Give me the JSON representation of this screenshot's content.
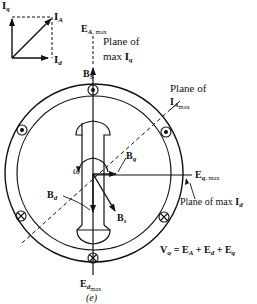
{
  "phasor": {
    "iq": {
      "sym": "I",
      "sub": "q"
    },
    "ia": {
      "sym": "I",
      "sub": "A"
    },
    "id": {
      "sym": "I",
      "sub": "d"
    }
  },
  "labels": {
    "ea_max": {
      "sym": "E",
      "sub": "A",
      "suffix": ", max"
    },
    "plane_iq": {
      "line1": "Plane of",
      "line2": "max ",
      "sym": "I",
      "sub": "q"
    },
    "bs_top": {
      "sym": "B",
      "sub": "S"
    },
    "plane_ia": {
      "line1": "Plane of",
      "sym": "I",
      "sub": "A",
      "subsub": "max"
    },
    "omega": "ω",
    "bq": {
      "sym": "B",
      "sub": "q"
    },
    "bd": {
      "sym": "B",
      "sub": "d"
    },
    "bs": {
      "sym": "B",
      "sub": "s"
    },
    "eq_max": {
      "sym": "E",
      "sub": "q",
      "suffix": ", max"
    },
    "plane_id": {
      "text": "Plane of max ",
      "sym": "I",
      "sub": "d"
    },
    "equation": {
      "v": "V",
      "vsub": "φ",
      "eq": " = ",
      "ea": "E",
      "easub": "A",
      "plus1": " + ",
      "ed": "E",
      "edsub": "d",
      "plus2": " + ",
      "eq2": "E",
      "eqsub": "q"
    },
    "ed_max": {
      "sym": "E",
      "sub": "d",
      "subsub": "max"
    },
    "caption": "(e)"
  },
  "colors": {
    "ink": "#111111",
    "background": "#ffffff"
  }
}
